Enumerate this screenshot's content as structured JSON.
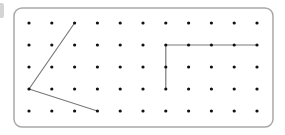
{
  "diagram": {
    "type": "dot-grid",
    "columns": 11,
    "rows": 5,
    "grid_origin": {
      "x": 29,
      "y": 23
    },
    "spacing": {
      "x": 22.8,
      "y": 22
    },
    "frame": {
      "x": 14,
      "y": 8,
      "width": 259,
      "height": 119,
      "radius": 8
    },
    "colors": {
      "frame": "#a8a8a8",
      "dot": "#111111",
      "line": "#7a7a7a",
      "edge_fragment": "#d4d4d4"
    },
    "shapes": [
      {
        "name": "acute-angle",
        "description": "Angle with vertex at left",
        "points": [
          [
            2,
            0
          ],
          [
            0,
            3
          ],
          [
            3,
            4
          ]
        ]
      },
      {
        "name": "right-angle",
        "description": "Right angle with vertex at top-left",
        "points": [
          [
            6,
            3
          ],
          [
            6,
            1
          ],
          [
            10,
            1
          ]
        ]
      }
    ]
  }
}
